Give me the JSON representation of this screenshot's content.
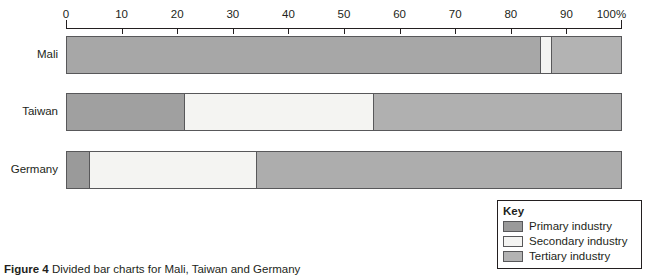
{
  "caption": {
    "figure_number": "Figure 4",
    "text": "Divided bar charts for Mali, Taiwan and Germany"
  },
  "axis": {
    "unit_suffix": "%",
    "ticks": [
      {
        "value": 0,
        "label": "0"
      },
      {
        "value": 10,
        "label": "10"
      },
      {
        "value": 20,
        "label": "20"
      },
      {
        "value": 30,
        "label": "30"
      },
      {
        "value": 40,
        "label": "40"
      },
      {
        "value": 50,
        "label": "50"
      },
      {
        "value": 60,
        "label": "60"
      },
      {
        "value": 70,
        "label": "70"
      },
      {
        "value": 80,
        "label": "80"
      },
      {
        "value": 90,
        "label": "90"
      },
      {
        "value": 100,
        "label": "100%"
      }
    ]
  },
  "legend": {
    "title": "Key",
    "items": [
      {
        "label": "Primary industry",
        "color": "#9a9a9a"
      },
      {
        "label": "Secondary industry",
        "color": "#f4f4f2"
      },
      {
        "label": "Tertiary industry",
        "color": "#b3b3b3"
      }
    ]
  },
  "bars": [
    {
      "label": "Mali",
      "segments": [
        {
          "series": "Primary industry",
          "value": 85,
          "color": "#a7a7a7"
        },
        {
          "series": "Secondary industry",
          "value": 2,
          "color": "#f4f4f2"
        },
        {
          "series": "Tertiary industry",
          "value": 13,
          "color": "#b3b3b3"
        }
      ]
    },
    {
      "label": "Taiwan",
      "segments": [
        {
          "series": "Primary industry",
          "value": 21,
          "color": "#a0a0a0"
        },
        {
          "series": "Secondary industry",
          "value": 34,
          "color": "#f4f4f2"
        },
        {
          "series": "Tertiary industry",
          "value": 45,
          "color": "#b0b0b0"
        }
      ]
    },
    {
      "label": "Germany",
      "segments": [
        {
          "series": "Primary industry",
          "value": 4,
          "color": "#9a9a9a"
        },
        {
          "series": "Secondary industry",
          "value": 30,
          "color": "#f4f4f2"
        },
        {
          "series": "Tertiary industry",
          "value": 66,
          "color": "#adadad"
        }
      ]
    }
  ],
  "chart_data": {
    "type": "bar",
    "subtype": "divided-bar-100-percent-stacked-horizontal",
    "title": "Divided bar charts for Mali, Taiwan and Germany",
    "xlabel": "",
    "ylabel": "",
    "xlim": [
      0,
      100
    ],
    "x_tick_labels": [
      "0",
      "10",
      "20",
      "30",
      "40",
      "50",
      "60",
      "70",
      "80",
      "90",
      "100%"
    ],
    "x_ticks": [
      0,
      10,
      20,
      30,
      40,
      50,
      60,
      70,
      80,
      90,
      100
    ],
    "grid": false,
    "orientation": "horizontal",
    "legend_position": "bottom-right",
    "categories": [
      "Mali",
      "Taiwan",
      "Germany"
    ],
    "series": [
      {
        "name": "Primary industry",
        "values": [
          85,
          21,
          4
        ],
        "color": "#9a9a9a"
      },
      {
        "name": "Secondary industry",
        "values": [
          2,
          34,
          30
        ],
        "color": "#f4f4f2"
      },
      {
        "name": "Tertiary industry",
        "values": [
          13,
          45,
          66
        ],
        "color": "#b3b3b3"
      }
    ],
    "annotations": []
  }
}
